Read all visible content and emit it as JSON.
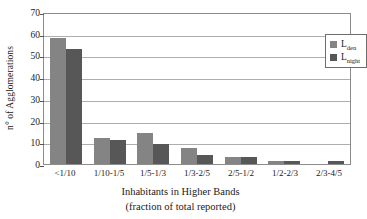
{
  "chart_data": {
    "type": "bar",
    "title": "",
    "xlabel": "Inhabitants in Higher Bands (fraction of total reported)",
    "xlabel_line1": "Inhabitants in Higher Bands",
    "xlabel_line2": "(fraction of total reported)",
    "ylabel": "n° of Agglomerations",
    "ylim": [
      0,
      70
    ],
    "ytick_values": [
      0,
      10,
      20,
      30,
      40,
      50,
      60,
      70
    ],
    "ytick_labels": [
      "0",
      "10",
      "20",
      "30",
      "40",
      "50",
      "60",
      "70"
    ],
    "grid": true,
    "legend_position": "top-right",
    "categories": [
      "<1/10",
      "1/10-1/5",
      "1/5-1/3",
      "1/3-2/5",
      "2/5-1/2",
      "1/2-2/3",
      "2/3-4/5"
    ],
    "series": [
      {
        "name": "Lden",
        "label_base": "L",
        "label_sub": "den",
        "color": "#848484",
        "values": [
          58,
          12.2,
          14.1,
          7.5,
          3.3,
          1.5,
          0
        ]
      },
      {
        "name": "Lnight",
        "label_base": "L",
        "label_sub": "night",
        "color": "#575757",
        "values": [
          53,
          11.2,
          9.1,
          4.3,
          3.3,
          1.5,
          1.5
        ]
      }
    ]
  }
}
